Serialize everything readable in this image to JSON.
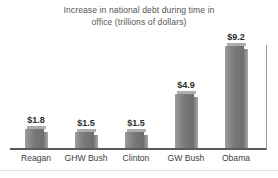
{
  "chart_data": {
    "type": "bar",
    "title": "Increase in national debt during time in\noffice (trillions of dollars)",
    "xlabel": "",
    "ylabel": "",
    "ylim": [
      0,
      9.2
    ],
    "grid": false,
    "legend": "none",
    "units": "trillions of dollars",
    "categories": [
      "Reagan",
      "GHW Bush",
      "Clinton",
      "GW Bush",
      "Obama"
    ],
    "values": [
      1.8,
      1.5,
      1.5,
      4.9,
      9.2
    ],
    "data_labels": [
      "$1.8",
      "$1.5",
      "$1.5",
      "$4.9",
      "$9.2"
    ],
    "bar_color": "#808080",
    "axis_color": "#5a5a5a",
    "title_color": "#555555",
    "label_color": "#404040"
  },
  "chart": {
    "title_line1": "Increase in national debt during time in",
    "title_line2": "office (trillions of dollars)",
    "bars": [
      {
        "category": "Reagan",
        "value": 1.8,
        "label": "$1.8"
      },
      {
        "category": "GHW Bush",
        "value": 1.5,
        "label": "$1.5"
      },
      {
        "category": "Clinton",
        "value": 1.5,
        "label": "$1.5"
      },
      {
        "category": "GW Bush",
        "value": 4.9,
        "label": "$4.9"
      },
      {
        "category": "Obama",
        "value": 9.2,
        "label": "$9.2"
      }
    ]
  }
}
